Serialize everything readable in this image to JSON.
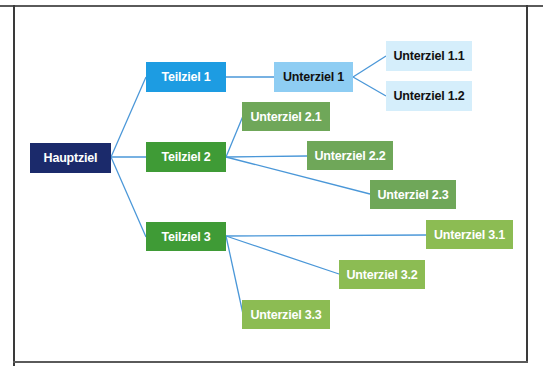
{
  "diagram": {
    "type": "goal-tree",
    "colors": {
      "main": "#1b2a6b",
      "subgoal_1": "#1d9ce2",
      "subgoal_1_child": "#8ecdf3",
      "subgoal_1_grandchild": "#d5eefb",
      "subgoal_2_3": "#3f9b36",
      "subgoal_2_children": "#6fa759",
      "subgoal_3_children": "#8cbc53",
      "connector": "#4a97d8"
    },
    "main": {
      "label": "Hauptziel"
    },
    "teilziele": [
      {
        "label": "Teilziel 1",
        "children": [
          {
            "label": "Unterziel 1",
            "children": [
              {
                "label": "Unterziel 1.1"
              },
              {
                "label": "Unterziel 1.2"
              }
            ]
          }
        ]
      },
      {
        "label": "Teilziel 2",
        "children": [
          {
            "label": "Unterziel 2.1"
          },
          {
            "label": "Unterziel 2.2"
          },
          {
            "label": "Unterziel 2.3"
          }
        ]
      },
      {
        "label": "Teilziel 3",
        "children": [
          {
            "label": "Unterziel 3.1"
          },
          {
            "label": "Unterziel 3.2"
          },
          {
            "label": "Unterziel 3.3"
          }
        ]
      }
    ]
  }
}
